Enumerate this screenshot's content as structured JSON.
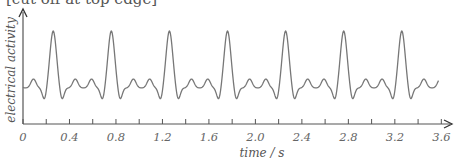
{
  "chart_data": {
    "type": "line",
    "title": "[cut off at top edge]",
    "xlabel": "time / s",
    "ylabel": "electrical activity",
    "xlim": [
      0,
      3.6
    ],
    "x_tick_labels": [
      "0",
      "0.4",
      "0.8",
      "1.2",
      "1.6",
      "2.0",
      "2.4",
      "2.8",
      "3.2",
      "3.6"
    ],
    "x_minor_tick_step": 0.2,
    "y_ticks": [],
    "grid": false,
    "legend": null,
    "series": [
      {
        "name": "ECG trace",
        "description": "Repeating ECG waveform; 7 tall R-wave peaks at approximately the listed times, with small P/T bumps and Q/S dips between.",
        "period_s": 0.5,
        "r_peak_times_s": [
          0.26,
          0.76,
          1.26,
          1.76,
          2.26,
          2.76,
          3.26
        ],
        "trace_start_s": 0.0,
        "trace_end_s": 3.58
      }
    ],
    "color": "#777777"
  }
}
